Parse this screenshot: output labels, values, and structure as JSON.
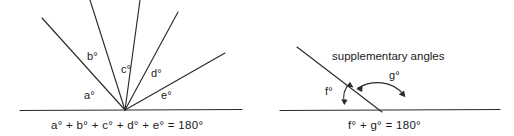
{
  "figure": {
    "background_color": "#ffffff",
    "line_color": "#2b2b2b",
    "text_color": "#1a1a1a"
  },
  "left_diagram": {
    "name": "angles-on-a-straight-line",
    "angle_labels": [
      {
        "key": "a",
        "text": "a°",
        "x": 84,
        "y": 90
      },
      {
        "key": "b",
        "text": "b°",
        "x": 87,
        "y": 51
      },
      {
        "key": "c",
        "text": "c°",
        "x": 121,
        "y": 64
      },
      {
        "key": "d",
        "text": "d°",
        "x": 151,
        "y": 68
      },
      {
        "key": "e",
        "text": "e°",
        "x": 161,
        "y": 90
      }
    ],
    "equation": "a° + b° + c° + d° + e° = 180°",
    "equation_x": 51,
    "equation_y": 121,
    "vertex": {
      "x": 125,
      "y": 110
    },
    "baseline": {
      "x1": 20,
      "y1": 110,
      "x2": 242,
      "y2": 109
    },
    "rays": [
      {
        "key": "ray-left-outer",
        "x2": 42,
        "y2": 18
      },
      {
        "key": "ray-b",
        "x2": 90,
        "y2": 0
      },
      {
        "key": "ray-c",
        "x2": 140,
        "y2": 0
      },
      {
        "key": "ray-d",
        "x2": 178,
        "y2": 12
      },
      {
        "key": "ray-e",
        "x2": 225,
        "y2": 53
      }
    ]
  },
  "right_diagram": {
    "name": "supplementary-angles",
    "caption": "supplementary angles",
    "caption_x": 332,
    "caption_y": 52,
    "angle_labels": [
      {
        "key": "f",
        "text": "f°",
        "x": 325,
        "y": 87
      },
      {
        "key": "g",
        "text": "g°",
        "x": 389,
        "y": 73
      }
    ],
    "equation": "f° + g° = 180°",
    "equation_x": 348,
    "equation_y": 121,
    "vertex": {
      "x": 378,
      "y": 110
    },
    "baseline": {
      "x1": 280,
      "y1": 110,
      "x2": 500,
      "y2": 109
    },
    "transversal": {
      "x1": 297,
      "y1": 47,
      "x2": 382,
      "y2": 112
    }
  }
}
